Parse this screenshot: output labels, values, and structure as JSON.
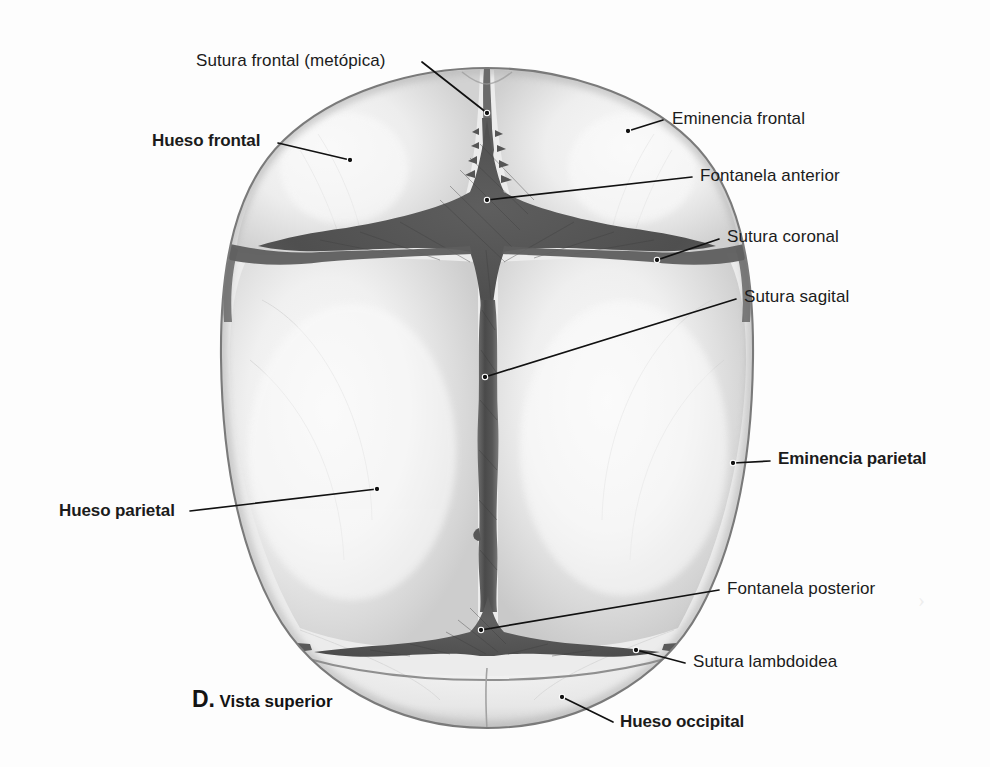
{
  "figure": {
    "caption_letter": "D.",
    "caption_text": "Vista superior",
    "background_color": "#fdfdfd",
    "bone_fill": "#e6e6e6",
    "bone_fill_light": "#f2f2f2",
    "suture_dark": "#4a4a4a",
    "fontanelle_dark": "#595959",
    "outline_color": "#6b6b6b",
    "leader_color": "#111111",
    "text_color": "#1b1b1b"
  },
  "labels": [
    {
      "id": "sutura-frontal-metopica",
      "text": "Sutura frontal (metópica)",
      "bold": false,
      "align": "left",
      "x": 196,
      "y": 52,
      "leader": [
        [
          422,
          62
        ],
        [
          487,
          113
        ]
      ],
      "dot": [
        487,
        113
      ]
    },
    {
      "id": "hueso-frontal",
      "text": "Hueso frontal",
      "bold": true,
      "align": "left",
      "x": 152,
      "y": 132,
      "leader": [
        [
          278,
          143
        ],
        [
          350,
          160
        ]
      ],
      "dot": [
        350,
        160
      ]
    },
    {
      "id": "eminencia-frontal",
      "text": "Eminencia frontal",
      "bold": false,
      "align": "left",
      "x": 672,
      "y": 110,
      "leader": [
        [
          663,
          120
        ],
        [
          628,
          131
        ]
      ],
      "dot": [
        628,
        131
      ]
    },
    {
      "id": "fontanela-anterior",
      "text": "Fontanela anterior",
      "bold": false,
      "align": "left",
      "x": 700,
      "y": 167,
      "leader": [
        [
          692,
          177
        ],
        [
          487,
          200
        ]
      ],
      "dot": [
        487,
        200
      ]
    },
    {
      "id": "sutura-coronal",
      "text": "Sutura coronal",
      "bold": false,
      "align": "left",
      "x": 727,
      "y": 228,
      "leader": [
        [
          719,
          239
        ],
        [
          657,
          260
        ]
      ],
      "dot": [
        657,
        260
      ]
    },
    {
      "id": "sutura-sagital",
      "text": "Sutura sagital",
      "bold": false,
      "align": "left",
      "x": 744,
      "y": 288,
      "leader": [
        [
          736,
          299
        ],
        [
          485,
          377
        ]
      ],
      "dot": [
        485,
        377
      ]
    },
    {
      "id": "eminencia-parietal",
      "text": "Eminencia parietal",
      "bold": true,
      "align": "left",
      "x": 778,
      "y": 450,
      "leader": [
        [
          770,
          461
        ],
        [
          733,
          463
        ]
      ],
      "dot": [
        733,
        463
      ]
    },
    {
      "id": "hueso-parietal",
      "text": "Hueso parietal",
      "bold": true,
      "align": "left",
      "x": 59,
      "y": 502,
      "leader": [
        [
          190,
          511
        ],
        [
          377,
          489
        ]
      ],
      "dot": [
        377,
        489
      ]
    },
    {
      "id": "fontanela-posterior",
      "text": "Fontanela posterior",
      "bold": false,
      "align": "left",
      "x": 727,
      "y": 580,
      "leader": [
        [
          719,
          590
        ],
        [
          481,
          630
        ]
      ],
      "dot": [
        481,
        630
      ]
    },
    {
      "id": "sutura-lambdoidea",
      "text": "Sutura lambdoidea",
      "bold": false,
      "align": "left",
      "x": 693,
      "y": 653,
      "leader": [
        [
          685,
          663
        ],
        [
          636,
          650
        ]
      ],
      "dot": [
        636,
        650
      ]
    },
    {
      "id": "hueso-occipital",
      "text": "Hueso occipital",
      "bold": true,
      "align": "left",
      "x": 620,
      "y": 713,
      "leader": [
        [
          613,
          722
        ],
        [
          562,
          697
        ]
      ],
      "dot": [
        562,
        697
      ]
    }
  ],
  "anatomy": {
    "parts": [
      "Hueso frontal",
      "Hueso parietal",
      "Hueso occipital"
    ],
    "sutures": [
      "Sutura frontal (metópica)",
      "Sutura coronal",
      "Sutura sagital",
      "Sutura lambdoidea"
    ],
    "fontanelles": [
      "Fontanela anterior",
      "Fontanela posterior"
    ],
    "eminences": [
      "Eminencia frontal",
      "Eminencia parietal"
    ]
  }
}
